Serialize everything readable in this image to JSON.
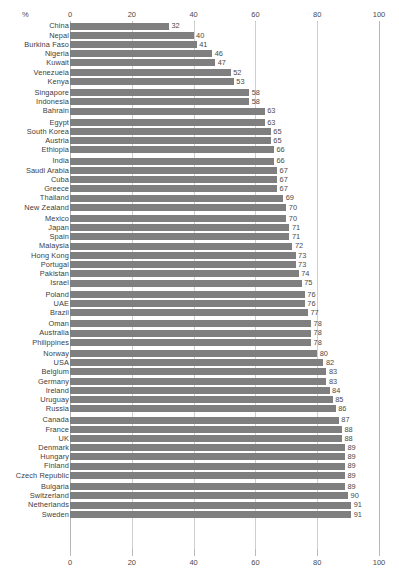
{
  "chart_data": {
    "type": "bar",
    "orientation": "horizontal",
    "title": "",
    "subtitle": "",
    "xlabel": "%",
    "ylabel": "",
    "xlim": [
      0,
      100
    ],
    "grid": true,
    "legend": null,
    "axis_ticks": [
      0,
      20,
      40,
      60,
      80,
      100
    ],
    "axis_tick_labels": [
      "0",
      "20",
      "40",
      "60",
      "80",
      "100"
    ],
    "axis_positions": [
      "top",
      "bottom"
    ],
    "unit_label": "%",
    "bar_color": "#7f7f7f",
    "categories": [
      "China",
      "Nepal",
      "Burkina Faso",
      "Nigeria",
      "Kuwait",
      "Venezuela",
      "Kenya",
      "Singapore",
      "Indonesia",
      "Bahrain",
      "Egypt",
      "South Korea",
      "Austria",
      "Ethiopia",
      "India",
      "Saudi Arabia",
      "Cuba",
      "Greece",
      "Thailand",
      "New Zealand",
      "Mexico",
      "Japan",
      "Spain",
      "Malaysia",
      "Hong Kong",
      "Portugal",
      "Pakistan",
      "Israel",
      "Poland",
      "UAE",
      "Brazil",
      "Oman",
      "Australia",
      "Philippines",
      "Norway",
      "USA",
      "Belgium",
      "Germany",
      "Ireland",
      "Uruguay",
      "Russia",
      "Canada",
      "France",
      "UK",
      "Denmark",
      "Hungary",
      "Finland",
      "Czech Republic",
      "Bulgaria",
      "Switzerland",
      "Netherlands",
      "Sweden"
    ],
    "values": [
      32,
      40,
      41,
      46,
      47,
      52,
      53,
      58,
      58,
      63,
      63,
      65,
      65,
      66,
      66,
      67,
      67,
      67,
      69,
      70,
      70,
      71,
      71,
      72,
      73,
      73,
      74,
      75,
      76,
      76,
      77,
      78,
      78,
      78,
      80,
      82,
      83,
      83,
      84,
      85,
      86,
      87,
      88,
      88,
      89,
      89,
      89,
      89,
      89,
      90,
      91,
      91
    ],
    "group_breaks_after_index": [
      6,
      9,
      13,
      19,
      27,
      30,
      33,
      40,
      47
    ]
  }
}
